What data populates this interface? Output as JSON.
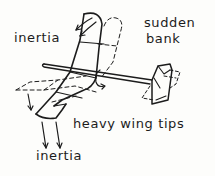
{
  "diagram": {
    "labels": {
      "inertia_top": "inertia",
      "sudden": "sudden",
      "bank": "bank",
      "heavy_wing_tips": "heavy wing tips",
      "inertia_bottom": "inertia"
    },
    "elements": {
      "wing_current": "solid outline",
      "wing_previous_position": "dashed outline",
      "fuselage": "solid stick",
      "tail": "solid with dashed previous position",
      "roll_arrow": "curved arrow around fuselage",
      "inertia_arrows_top": 2,
      "inertia_arrows_bottom": 2,
      "inertia_arrow_left_tip": 1
    },
    "colors": {
      "ink": "#1c1c1c",
      "paper": "#fdfdfb"
    }
  }
}
